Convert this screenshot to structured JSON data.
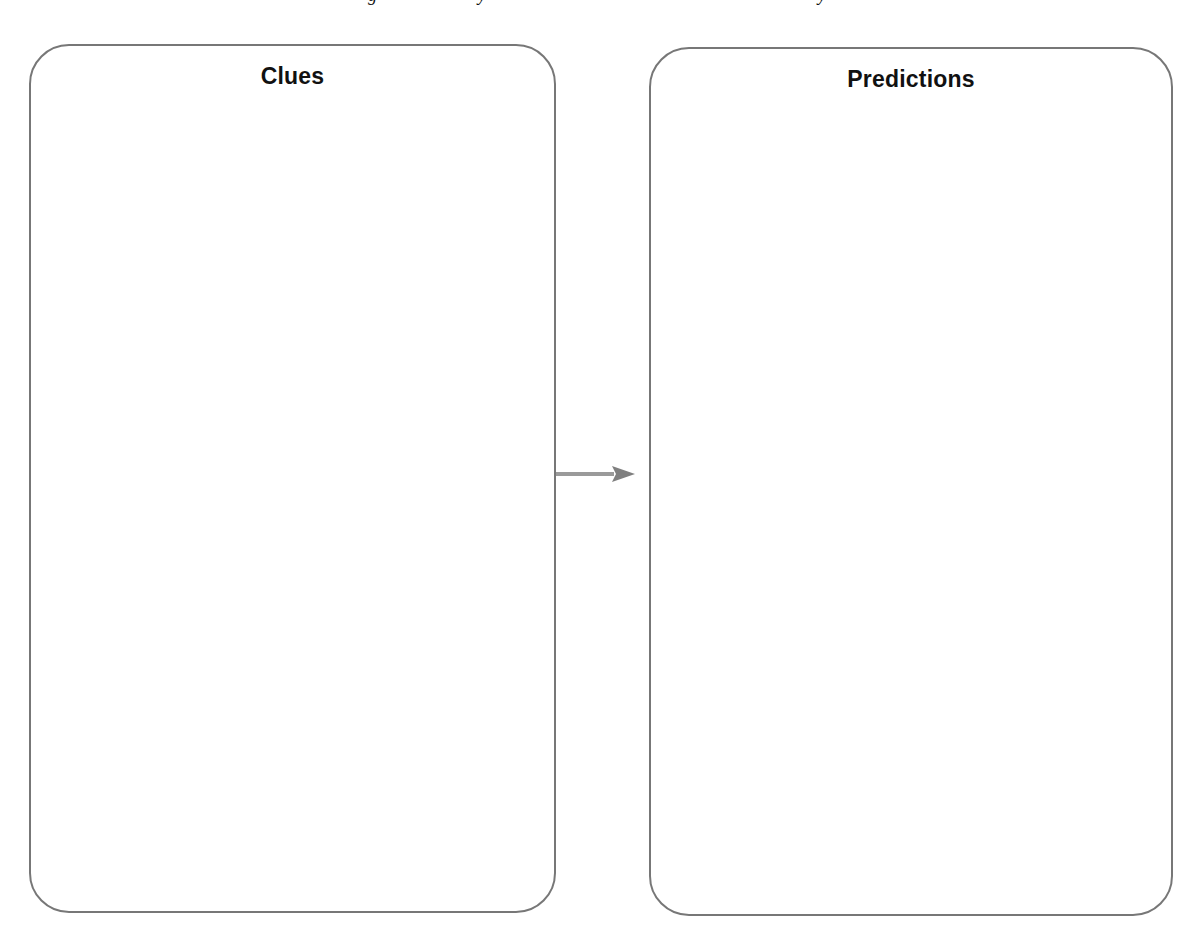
{
  "page": {
    "background": "#ffffff",
    "clipped_top_line": {
      "note_visible": "only descenders of a cropped line are visible",
      "glyphs": [
        {
          "char": "g",
          "x": 368
        },
        {
          "char": "y",
          "x": 478
        },
        {
          "char": "y",
          "x": 818
        }
      ]
    }
  },
  "organizer": {
    "border_color": "#777777",
    "arrow_color": "#8a8a8a",
    "panels": [
      {
        "id": "clues",
        "title": "Clues",
        "content": ""
      },
      {
        "id": "predictions",
        "title": "Predictions",
        "content": ""
      }
    ],
    "connector": {
      "type": "arrow",
      "direction": "right",
      "from": "clues",
      "to": "predictions"
    }
  }
}
